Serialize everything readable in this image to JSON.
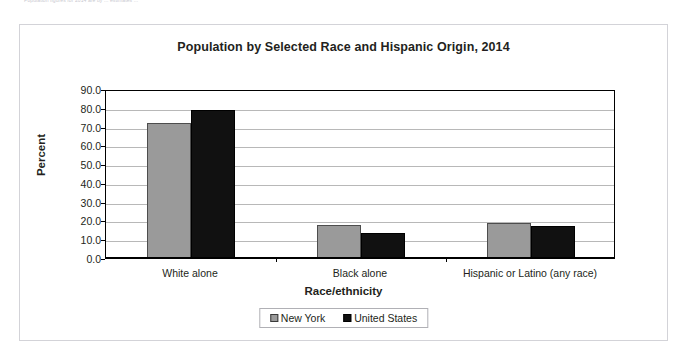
{
  "clipped_header_text": "Population figures for 2014 are by ... estimates ...",
  "chart_data": {
    "type": "bar",
    "title": "Population by Selected Race and Hispanic Origin, 2014",
    "xlabel": "Race/ethnicity",
    "ylabel": "Percent",
    "categories": [
      "White alone",
      "Black alone",
      "Hispanic or Latino (any race)"
    ],
    "series": [
      {
        "name": "New York",
        "color": "#9a9a9a",
        "values": [
          71.9,
          17.6,
          18.6
        ]
      },
      {
        "name": "United States",
        "color": "#111111",
        "values": [
          78.6,
          13.3,
          17.3
        ]
      }
    ],
    "ylim": [
      0.0,
      90.0
    ],
    "ytick_step": 10.0,
    "ytick_labels": [
      "90.0",
      "80.0",
      "70.0",
      "60.0",
      "50.0",
      "40.0",
      "30.0",
      "20.0",
      "10.0",
      "0.0"
    ],
    "grid": true,
    "legend_position": "bottom"
  }
}
